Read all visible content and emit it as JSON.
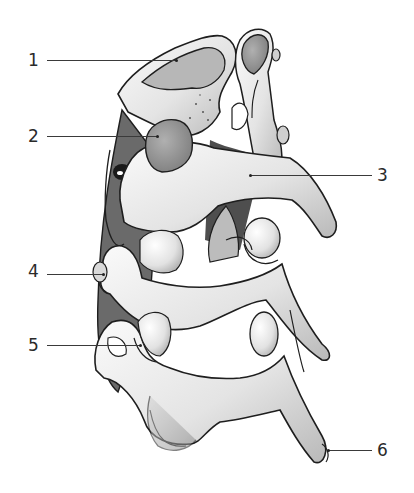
{
  "figure": {
    "colors": {
      "bone_light": "#f2f2f2",
      "bone_mid": "#cfcfcf",
      "bone_dark": "#8e8e8e",
      "facet": "#9a9a9a",
      "outline": "#1e1e1e",
      "shadow": "#3a3a3a"
    }
  },
  "labels": [
    {
      "id": "1",
      "text": "1",
      "side": "left",
      "label_x": 28,
      "label_y": 52,
      "line_x1": 47,
      "line_x2": 176,
      "line_y": 60,
      "dot_x": 176,
      "dot_y": 60
    },
    {
      "id": "2",
      "text": "2",
      "side": "left",
      "label_x": 28,
      "label_y": 128,
      "line_x1": 47,
      "line_x2": 157,
      "line_y": 136,
      "dot_x": 157,
      "dot_y": 136
    },
    {
      "id": "3",
      "text": "3",
      "side": "right",
      "label_x": 377,
      "label_y": 167,
      "line_x1": 250,
      "line_x2": 372,
      "line_y": 175,
      "dot_x": 250,
      "dot_y": 175
    },
    {
      "id": "4",
      "text": "4",
      "side": "left",
      "label_x": 28,
      "label_y": 263,
      "line_x1": 47,
      "line_x2": 103,
      "line_y": 274,
      "dot_x": 103,
      "dot_y": 274
    },
    {
      "id": "5",
      "text": "5",
      "side": "left",
      "label_x": 28,
      "label_y": 337,
      "line_x1": 47,
      "line_x2": 140,
      "line_y": 345,
      "dot_x": 140,
      "dot_y": 345
    },
    {
      "id": "6",
      "text": "6",
      "side": "right",
      "label_x": 377,
      "label_y": 442,
      "line_x1": 328,
      "line_x2": 372,
      "line_y": 450,
      "dot_x": 328,
      "dot_y": 450
    }
  ]
}
